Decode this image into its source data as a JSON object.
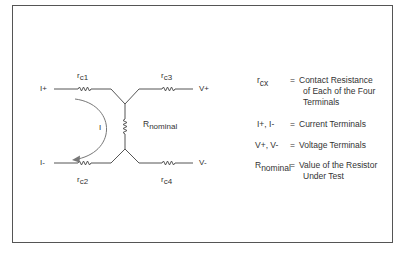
{
  "diagram": {
    "terminals": {
      "i_plus": "I+",
      "i_minus": "I-",
      "v_plus": "V+",
      "v_minus": "V-"
    },
    "resistors": {
      "rc1": {
        "base": "r",
        "sub": "c1"
      },
      "rc2": {
        "base": "r",
        "sub": "c2"
      },
      "rc3": {
        "base": "r",
        "sub": "c3"
      },
      "rc4": {
        "base": "r",
        "sub": "c4"
      },
      "rnominal": {
        "base": "R",
        "sub": "nominal"
      }
    },
    "current_label": "I",
    "colors": {
      "border": "#555555",
      "wire": "#555555",
      "arrow": "#777777",
      "text": "#333333"
    }
  },
  "legend": [
    {
      "key_base": "r",
      "key_sub": "cx",
      "eq": "=",
      "desc": [
        "Contact Resistance",
        "of Each of the Four",
        "Terminals"
      ]
    },
    {
      "key_base": "I+, I-",
      "key_sub": "",
      "eq": "=",
      "desc": [
        "Current Terminals"
      ]
    },
    {
      "key_base": "V+, V-",
      "key_sub": "",
      "eq": "=",
      "desc": [
        "Voltage Terminals"
      ]
    },
    {
      "key_base": "R",
      "key_sub": "nominal",
      "eq": "=",
      "desc": [
        "Value of the Resistor",
        "Under Test"
      ]
    }
  ]
}
